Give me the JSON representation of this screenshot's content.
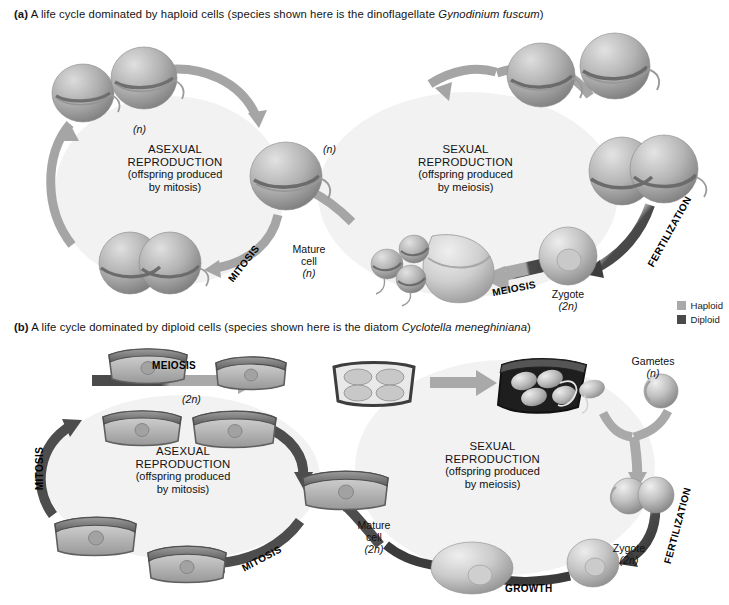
{
  "figure": {
    "panel_a": {
      "label": "(a)",
      "caption_text": "A life cycle dominated by haploid cells (species shown here is the dinoflagellate ",
      "species": "Gynodinium fuscum",
      "caption_tail": ")",
      "asexual": {
        "line1": "ASEXUAL",
        "line2": "REPRODUCTION",
        "line3": "(offspring produced",
        "line4": "by mitosis)"
      },
      "sexual": {
        "line1": "SEXUAL",
        "line2": "REPRODUCTION",
        "line3": "(offspring produced",
        "line4": "by meiosis)"
      },
      "stages": {
        "mitosis": "MITOSIS",
        "meiosis": "MEIOSIS",
        "fertilization": "FERTILIZATION"
      },
      "annotations": {
        "mature_cell_line1": "Mature",
        "mature_cell_line2": "cell",
        "mature_cell_ploidy": "(n)",
        "zygote_label": "Zygote",
        "zygote_ploidy": "(2n)",
        "offspring_ploidy_left": "(n)",
        "offspring_ploidy_right": "(n)"
      }
    },
    "panel_b": {
      "label": "(b)",
      "caption_text": "A life cycle dominated by diploid cells (species shown here is the diatom ",
      "species": "Cyclotella meneghiniana",
      "caption_tail": ")",
      "asexual": {
        "line1": "ASEXUAL",
        "line2": "REPRODUCTION",
        "line3": "(offspring produced",
        "line4": "by mitosis)"
      },
      "sexual": {
        "line1": "SEXUAL",
        "line2": "REPRODUCTION",
        "line3": "(offspring produced",
        "line4": "by meiosis)"
      },
      "stages": {
        "mitosis_left": "MITOSIS",
        "mitosis_bottom": "MITOSIS",
        "meiosis": "MEIOSIS",
        "fertilization": "FERTILIZATION",
        "growth": "GROWTH"
      },
      "annotations": {
        "top_ploidy": "(2n)",
        "gametes_label": "Gametes",
        "gametes_ploidy": "(n)",
        "mature_cell_line1": "Mature",
        "mature_cell_line2": "cell",
        "mature_cell_ploidy": "(2n)",
        "zygote_label": "Zygote",
        "zygote_ploidy": "(2n)"
      }
    },
    "legend": {
      "haploid_label": "Haploid",
      "diploid_label": "Diploid",
      "haploid_color": "#a9a9a9",
      "diploid_color": "#4a4a4a"
    }
  }
}
